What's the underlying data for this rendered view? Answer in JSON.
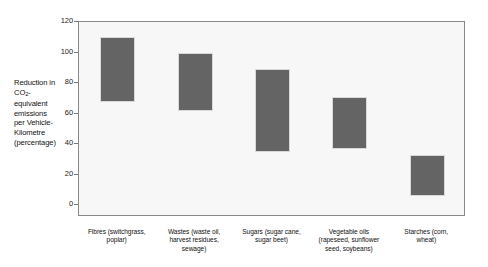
{
  "chart_data": {
    "type": "bar",
    "title": "",
    "subtitle": "",
    "xlabel": "",
    "ylabel": "Reduction in CO2-equivalent emissions per Vehicle-Kilometre (percentage)",
    "ylabel_lines": [
      "Reduction in",
      "CO2-",
      "equivalent",
      "emissions",
      "per Vehicle-",
      "Kilometre",
      "(percentage)"
    ],
    "ylim": [
      0,
      120
    ],
    "yticks": [
      0,
      20,
      40,
      60,
      80,
      100,
      120
    ],
    "ytick_labels": [
      "0",
      "20",
      "40",
      "60",
      "80",
      "100",
      "120"
    ],
    "grid": false,
    "legend": "none",
    "bar_style": "floating-range",
    "series_note": "Each bar spans a low-to-high estimate range",
    "categories": [
      "Fibres (switchgrass, poplar)",
      "Wastes (waste oil, harvest residues, sewage)",
      "Sugars (sugar cane, sugar beet)",
      "Vegetable oils (rapeseed, sunflower seed, soybeans)",
      "Starches (corn, wheat)"
    ],
    "category_lines": [
      [
        "Fibres (switchgrass,",
        "poplar)"
      ],
      [
        "Wastes (waste oil,",
        "harvest residues,",
        "sewage)"
      ],
      [
        "Sugars (sugar cane,",
        "sugar beet)"
      ],
      [
        "Vegetable oils",
        "(rapeseed, sunflower",
        "seed, soybeans)"
      ],
      [
        "Starches (corn,",
        "wheat)"
      ]
    ],
    "series": [
      {
        "name": "Range low",
        "values": [
          71,
          65,
          40,
          42,
          13
        ]
      },
      {
        "name": "Range high",
        "values": [
          111,
          101,
          91,
          74,
          38
        ]
      }
    ],
    "bars": [
      {
        "category": "Fibres (switchgrass, poplar)",
        "low": 71,
        "high": 111
      },
      {
        "category": "Wastes (waste oil, harvest residues, sewage)",
        "low": 65,
        "high": 101
      },
      {
        "category": "Sugars (sugar cane, sugar beet)",
        "low": 40,
        "high": 91
      },
      {
        "category": "Vegetable oils (rapeseed, sunflower seed, soybeans)",
        "low": 42,
        "high": 74
      },
      {
        "category": "Starches (corn, wheat)",
        "low": 13,
        "high": 38
      }
    ],
    "colors": {
      "bar_fill": "#646464",
      "plot_background": "#f7f7f7",
      "frame": "#888888",
      "text": "#111111",
      "page_background": "#ffffff"
    }
  }
}
